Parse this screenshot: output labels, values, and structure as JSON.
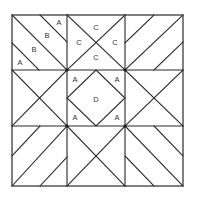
{
  "diagram": {
    "type": "quilt-block-pattern",
    "grid": "3x3",
    "colors": {
      "line": "#2a2a2a",
      "background": "#ffffff",
      "label": "#333333"
    },
    "cells": {
      "top_left": {
        "pattern": "diagonal-stripes",
        "labels": [
          "A",
          "B",
          "B",
          "A"
        ]
      },
      "top_center": {
        "pattern": "x-cross",
        "labels": [
          "C",
          "C",
          "C",
          "C"
        ]
      },
      "top_right": {
        "pattern": "diagonal-stripes",
        "labels": []
      },
      "middle_left": {
        "pattern": "x-cross",
        "labels": []
      },
      "center": {
        "pattern": "square-in-square",
        "labels": [
          "A",
          "A",
          "D",
          "A",
          "A"
        ]
      },
      "middle_right": {
        "pattern": "x-cross",
        "labels": []
      },
      "bottom_left": {
        "pattern": "diagonal-stripes",
        "labels": []
      },
      "bottom_center": {
        "pattern": "x-cross",
        "labels": []
      },
      "bottom_right": {
        "pattern": "diagonal-stripes",
        "labels": []
      }
    },
    "labels": {
      "tl_a1": "A",
      "tl_b1": "B",
      "tl_b2": "B",
      "tl_a2": "A",
      "tc_top": "C",
      "tc_left": "C",
      "tc_right": "C",
      "tc_bottom": "C",
      "ctr_a_tl": "A",
      "ctr_a_tr": "A",
      "ctr_d": "D",
      "ctr_a_bl": "A",
      "ctr_a_br": "A"
    }
  }
}
